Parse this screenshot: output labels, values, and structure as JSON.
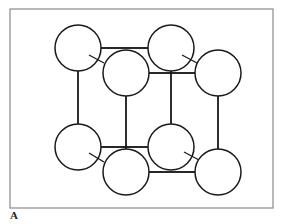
{
  "figure": {
    "panel_label": "A",
    "colors": {
      "frame": "#8a8a8a",
      "stroke": "#1a1a1a",
      "atom_fill": "#ffffff"
    },
    "frame_box": {
      "x": 10,
      "y": 9,
      "width": 263,
      "height": 199
    },
    "atom_radius": 23,
    "atoms": [
      {
        "id": "back-top-left",
        "cx": 78,
        "cy": 48
      },
      {
        "id": "back-top-right",
        "cx": 171,
        "cy": 48
      },
      {
        "id": "back-bottom-left",
        "cx": 78,
        "cy": 147
      },
      {
        "id": "back-bottom-right",
        "cx": 171,
        "cy": 147
      },
      {
        "id": "front-top-left",
        "cx": 126,
        "cy": 73
      },
      {
        "id": "front-top-right",
        "cx": 218,
        "cy": 73
      },
      {
        "id": "front-bottom-left",
        "cx": 126,
        "cy": 172
      },
      {
        "id": "front-bottom-right",
        "cx": 218,
        "cy": 172
      }
    ]
  }
}
